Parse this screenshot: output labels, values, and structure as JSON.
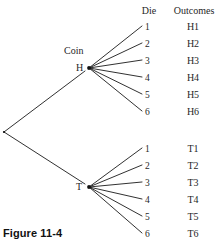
{
  "figure": {
    "caption": "Figure 11-4",
    "type": "probability-tree-diagram"
  },
  "columns": {
    "stage1_header": "Coin",
    "stage2_header": "Die",
    "outcomes_header": "Outcomes"
  },
  "tree": {
    "root": {
      "x": 4,
      "y": 132
    },
    "branches": [
      {
        "label": "H",
        "node": {
          "x": 89,
          "y": 68
        },
        "label_pos": {
          "x": 76,
          "y": 63
        },
        "children": [
          {
            "die": "1",
            "outcome": "H1",
            "y": 22
          },
          {
            "die": "2",
            "outcome": "H2",
            "y": 39
          },
          {
            "die": "3",
            "outcome": "H3",
            "y": 56
          },
          {
            "die": "4",
            "outcome": "H4",
            "y": 73
          },
          {
            "die": "5",
            "outcome": "H5",
            "y": 90
          },
          {
            "die": "6",
            "outcome": "H6",
            "y": 107
          }
        ]
      },
      {
        "label": "T",
        "node": {
          "x": 89,
          "y": 187
        },
        "label_pos": {
          "x": 76,
          "y": 182
        },
        "children": [
          {
            "die": "1",
            "outcome": "T1",
            "y": 144
          },
          {
            "die": "2",
            "outcome": "T2",
            "y": 161
          },
          {
            "die": "3",
            "outcome": "T3",
            "y": 178
          },
          {
            "die": "4",
            "outcome": "T4",
            "y": 195
          },
          {
            "die": "5",
            "outcome": "T5",
            "y": 212
          },
          {
            "die": "6",
            "outcome": "T6",
            "y": 229
          }
        ]
      }
    ]
  },
  "geometry": {
    "die_label_x": 145,
    "die_line_end_x": 142,
    "outcome_label_x": 193,
    "stage2_header_x": 149,
    "outcomes_header_x": 194,
    "header_y": 6,
    "caption_pos": {
      "x": 3,
      "y": 228
    }
  },
  "style": {
    "line_color": "#1a1a1a",
    "text_color": "#1f1f1f",
    "background": "#ffffff"
  }
}
